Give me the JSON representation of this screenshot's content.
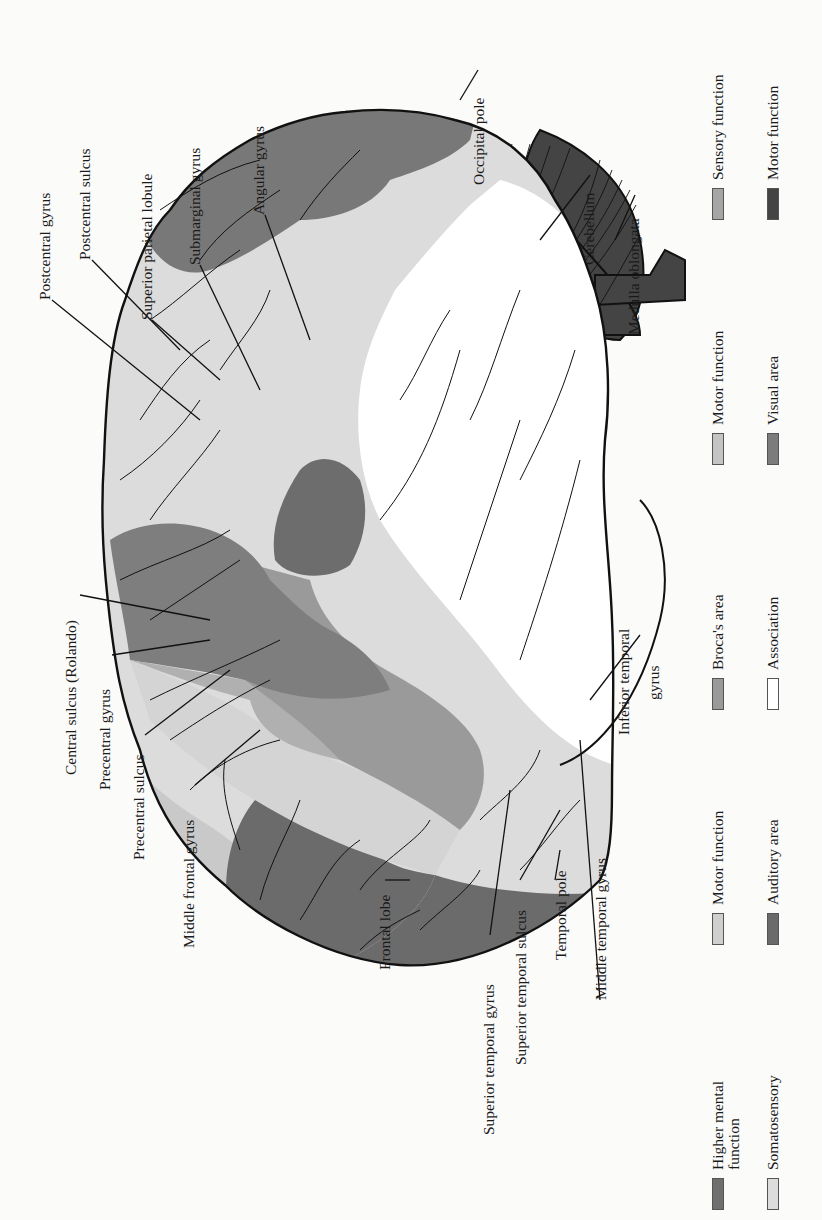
{
  "figure": {
    "orientation": "rotated 90 degrees counter-clockwise"
  },
  "colors": {
    "higher_mental": "#6f6f6f",
    "somatosensory": "#dcdcdc",
    "motor_light": "#cfcfcf",
    "auditory": "#6a6a6a",
    "broca": "#9a9a9a",
    "association": "#ffffff",
    "motor_mid": "#c4c4c4",
    "visual": "#7c7c7c",
    "sensory": "#a6a6a6",
    "motor_dark": "#444444",
    "outline": "#1a1a1a"
  },
  "labels": {
    "postcentral_gyrus": "Postcentral gyrus",
    "postcentral_sulcus": "Postcentral sulcus",
    "superior_parietal_lobule": "Superior parietal lobule",
    "submarginal_gyrus": "Submarginal gyrus",
    "angular_gyrus": "Angular gyrus",
    "occipital_pole": "Occipital pole",
    "cerebellum": "Cerebellum",
    "medulla_oblongata": "Medulla oblongata",
    "central_sulcus": "Central sulcus (Rolando)",
    "precentral_gyrus": "Precentral gyrus",
    "precentral_sulcus": "Precentral sulcus",
    "middle_frontal_gyrus": "Middle frontal gyrus",
    "frontal_lobe": "Frontal lobe",
    "superior_temporal_gyrus": "Superior temporal gyrus",
    "superior_temporal_sulcus": "Superior temporal sulcus",
    "temporal_pole": "Temporal pole",
    "middle_temporal_gyrus": "Middle temporal gyrus",
    "inferior_temporal_gyrus_1": "Inferior temporal",
    "inferior_temporal_gyrus_2": "gyrus"
  },
  "legend": [
    {
      "label": "Higher mental function",
      "color_key": "higher_mental"
    },
    {
      "label": "Somatosensory",
      "color_key": "somatosensory"
    },
    {
      "label": "Motor function",
      "color_key": "motor_light"
    },
    {
      "label": "Auditory area",
      "color_key": "auditory"
    },
    {
      "label": "Broca's area",
      "color_key": "broca"
    },
    {
      "label": "Association",
      "color_key": "association"
    },
    {
      "label": "Motor function",
      "color_key": "motor_mid"
    },
    {
      "label": "Visual area",
      "color_key": "visual"
    },
    {
      "label": "Sensory function",
      "color_key": "sensory"
    },
    {
      "label": "Motor function",
      "color_key": "motor_dark"
    }
  ]
}
